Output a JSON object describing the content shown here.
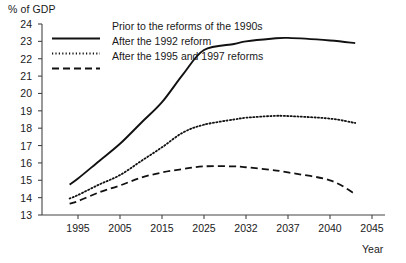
{
  "chart_data": {
    "type": "line",
    "title": "",
    "xlabel": "Year",
    "ylabel": "% of GDP",
    "ylim": [
      13,
      24
    ],
    "grid": false,
    "legend_position": "top-left",
    "ytick_labels": [
      "24",
      "23",
      "22",
      "21",
      "20",
      "19",
      "18",
      "17",
      "16",
      "15",
      "14",
      "13"
    ],
    "xtick_labels": [
      "1995",
      "2005",
      "2015",
      "2025",
      "2032",
      "2037",
      "2040",
      "2045"
    ],
    "x": [
      1993,
      1995,
      2000,
      2005,
      2010,
      2015,
      2020,
      2025,
      2030,
      2032,
      2035,
      2037,
      2040,
      2043
    ],
    "series": [
      {
        "name": "Prior to the reforms of the 1990s",
        "style": "solid",
        "color": "#111111",
        "values": [
          14.75,
          15.1,
          16.1,
          17.1,
          18.3,
          19.5,
          21.1,
          22.5,
          22.85,
          23.0,
          23.15,
          23.2,
          23.05,
          22.9
        ]
      },
      {
        "name": "After the 1992 reform",
        "style": "dotted",
        "color": "#111111",
        "values": [
          13.95,
          14.15,
          14.75,
          15.3,
          16.1,
          16.9,
          17.75,
          18.2,
          18.5,
          18.6,
          18.7,
          18.7,
          18.55,
          18.3
        ]
      },
      {
        "name": "After the 1995 and 1997 reforms",
        "style": "dashed",
        "color": "#111111",
        "values": [
          13.65,
          13.8,
          14.3,
          14.7,
          15.15,
          15.45,
          15.65,
          15.8,
          15.8,
          15.75,
          15.6,
          15.45,
          15.0,
          14.2
        ]
      }
    ]
  },
  "legend": {
    "items": [
      {
        "label": "Prior to the reforms of the 1990s",
        "style": "solid"
      },
      {
        "label": "After the 1992 reform",
        "style": "dotted"
      },
      {
        "label": "After the 1995 and 1997 reforms",
        "style": "dashed"
      }
    ]
  },
  "axes": {
    "y_title": "% of GDP",
    "x_title": "Year"
  }
}
